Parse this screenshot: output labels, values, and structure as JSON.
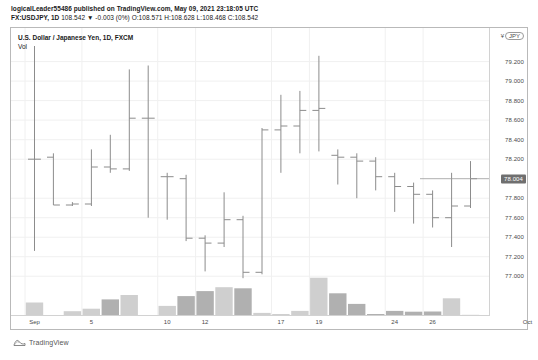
{
  "attribution": {
    "line1": "logicalLeader55486 published on TradingView.com, May 09, 2021 23:18:05 UTC",
    "line2_symbol": "FX:USDJPY, 1D",
    "line2_last": "108.542",
    "line2_arrow": "▼",
    "line2_change": "-0.003",
    "line2_percent": "(0%)",
    "line2_ohlc": "O:108.571 H:108.628 L:108.468 C:108.542"
  },
  "legend": {
    "title": "U.S. Dollar / Japanese Yen, 1D, FXCM",
    "volume_label": "Vol"
  },
  "price_scale": {
    "currency_prefix": "¥",
    "currency_tag": "JPY",
    "current_price_badge": "78.004"
  },
  "footer": {
    "brand": "TradingView",
    "logo_icon": "tradingview-logo-icon"
  },
  "colors": {
    "bar_stroke": "#8c8c8c",
    "volume_up": "#cfcfcf",
    "volume_down": "#b0b0b0",
    "grid": "#f0f0f0",
    "axis_text": "#4a4a4a",
    "badge_bg": "#6f6f6f",
    "frame_border": "#b9b9b9"
  },
  "chart_data": {
    "type": "bar",
    "subtype": "ohlc-bars-with-volume",
    "title": "U.S. Dollar / Japanese Yen, 1D, FXCM",
    "xlabel": "",
    "ylabel": "JPY",
    "ylim": [
      76.9,
      79.36
    ],
    "grid": true,
    "legend_position": "top-left",
    "price_ticks": [
      "79.200",
      "79.000",
      "78.800",
      "78.600",
      "78.400",
      "78.200",
      "77.800",
      "77.600",
      "77.400",
      "77.200",
      "77.000"
    ],
    "price_tick_values": [
      79.2,
      79.0,
      78.8,
      78.6,
      78.4,
      78.2,
      77.8,
      77.6,
      77.4,
      77.2,
      77.0
    ],
    "time_ticks": [
      {
        "label": "Sep",
        "index": 0
      },
      {
        "label": "5",
        "index": 3
      },
      {
        "label": "10",
        "index": 7
      },
      {
        "label": "12",
        "index": 9
      },
      {
        "label": "17",
        "index": 13
      },
      {
        "label": "19",
        "index": 15
      },
      {
        "label": "24",
        "index": 19
      },
      {
        "label": "26",
        "index": 21
      },
      {
        "label": "Oct",
        "index": 26
      }
    ],
    "volume_ylim": [
      0,
      2400
    ],
    "ohlc": [
      {
        "i": 0,
        "open": 78.2,
        "high": 79.36,
        "low": 77.26,
        "close": 78.2,
        "volume": 1450
      },
      {
        "i": 1,
        "open": 78.22,
        "high": 78.26,
        "low": 77.73,
        "close": 77.73,
        "volume": 880
      },
      {
        "i": 2,
        "open": 77.73,
        "high": 77.76,
        "low": 77.72,
        "close": 77.74,
        "volume": 1140
      },
      {
        "i": 3,
        "open": 77.74,
        "high": 78.3,
        "low": 77.72,
        "close": 78.12,
        "volume": 1230
      },
      {
        "i": 4,
        "open": 78.12,
        "high": 78.45,
        "low": 78.06,
        "close": 78.1,
        "volume": 1560
      },
      {
        "i": 5,
        "open": 78.1,
        "high": 79.12,
        "low": 78.08,
        "close": 78.62,
        "volume": 1720
      },
      {
        "i": 6,
        "open": 78.62,
        "high": 79.16,
        "low": 77.6,
        "close": 78.62,
        "volume": 820
      },
      {
        "i": 7,
        "open": 78.02,
        "high": 78.06,
        "low": 77.58,
        "close": 78.02,
        "volume": 1330
      },
      {
        "i": 8,
        "open": 78.0,
        "high": 78.04,
        "low": 77.36,
        "close": 77.39,
        "volume": 1680
      },
      {
        "i": 9,
        "open": 77.39,
        "high": 77.42,
        "low": 77.05,
        "close": 77.34,
        "volume": 1860
      },
      {
        "i": 10,
        "open": 77.34,
        "high": 77.86,
        "low": 77.3,
        "close": 77.58,
        "volume": 2000
      },
      {
        "i": 11,
        "open": 77.58,
        "high": 77.62,
        "low": 76.98,
        "close": 77.04,
        "volume": 1960
      },
      {
        "i": 12,
        "open": 77.04,
        "high": 78.52,
        "low": 77.02,
        "close": 78.5,
        "volume": 1080
      },
      {
        "i": 13,
        "open": 78.5,
        "high": 78.86,
        "low": 78.06,
        "close": 78.54,
        "volume": 1040
      },
      {
        "i": 14,
        "open": 78.54,
        "high": 78.9,
        "low": 78.26,
        "close": 78.7,
        "volume": 1150
      },
      {
        "i": 15,
        "open": 78.7,
        "high": 79.26,
        "low": 78.28,
        "close": 78.72,
        "volume": 2340
      },
      {
        "i": 16,
        "open": 78.24,
        "high": 78.3,
        "low": 77.94,
        "close": 78.22,
        "volume": 1780
      },
      {
        "i": 17,
        "open": 78.22,
        "high": 78.26,
        "low": 77.8,
        "close": 78.18,
        "volume": 1400
      },
      {
        "i": 18,
        "open": 78.18,
        "high": 78.22,
        "low": 77.88,
        "close": 78.02,
        "volume": 1040
      },
      {
        "i": 19,
        "open": 78.02,
        "high": 78.06,
        "low": 77.66,
        "close": 77.92,
        "volume": 1150
      },
      {
        "i": 20,
        "open": 77.92,
        "high": 77.96,
        "low": 77.54,
        "close": 77.84,
        "volume": 1120
      },
      {
        "i": 21,
        "open": 77.84,
        "high": 77.88,
        "low": 77.5,
        "close": 77.6,
        "volume": 1130
      },
      {
        "i": 22,
        "open": 77.6,
        "high": 78.06,
        "low": 77.3,
        "close": 77.72,
        "volume": 1600
      },
      {
        "i": 23,
        "open": 77.72,
        "high": 78.18,
        "low": 77.7,
        "close": 78.0,
        "volume": 1010
      }
    ]
  }
}
